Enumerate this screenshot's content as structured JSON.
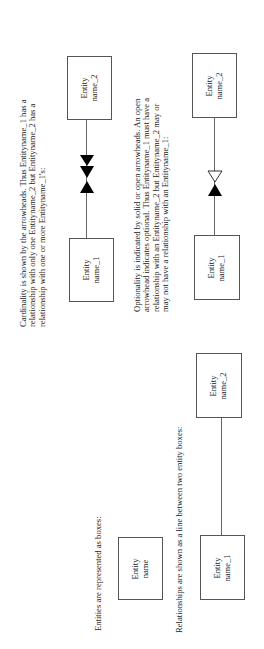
{
  "sections": {
    "cardinality": {
      "text_lines": [
        "Cardinality is shown by the arrowheads. Thus Entityname_1 has a",
        "relationship with only one Entityname_2 but Entityname_2 has a",
        "relationship with one or more Entityname_1's:"
      ],
      "box_top_label": [
        "Entity",
        "name_2"
      ],
      "box_bottom_label": [
        "Entity",
        "name_1"
      ],
      "arrowheads": [
        "solid",
        "solid",
        "solid-reverse"
      ]
    },
    "optionality": {
      "text_lines": [
        "Optionality is indicated by solid or open arrowheads. An open",
        "arrowhead indicates optional. Thus Entityname_1 must have a",
        "relationship with an Entityname_2 but Entityname_2 may or",
        "may not have a relationship with an Entityname_1:"
      ],
      "box_top_label": [
        "Entity",
        "name_2"
      ],
      "box_bottom_label": [
        "Entity",
        "name_1"
      ],
      "arrowheads": [
        "open",
        "solid"
      ]
    },
    "entities": {
      "text": "Entities are represented as boxes:",
      "box_label": [
        "Entity",
        "name"
      ]
    },
    "relationships": {
      "text": "Relationships are shown as a line between two entity boxes:",
      "box_top_label": [
        "Entity",
        "name_2"
      ],
      "box_bottom_label": [
        "Entity",
        "name_1"
      ]
    }
  },
  "colors": {
    "line": "#666666",
    "box_border": "#555555",
    "arrow": "#000000",
    "text": "#222222"
  }
}
